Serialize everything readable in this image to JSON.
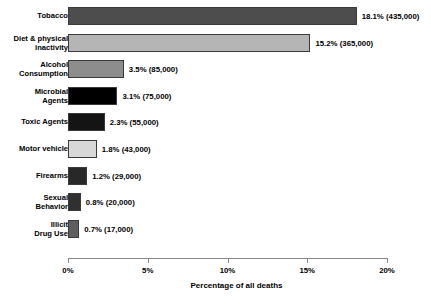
{
  "chart_data": {
    "type": "bar",
    "orientation": "horizontal",
    "title": "",
    "xlabel": "Percentage of all deaths",
    "ylabel": "",
    "xlim": [
      0,
      20
    ],
    "grid": false,
    "legend": "none",
    "xticks": [
      "0%",
      "5%",
      "10%",
      "15%",
      "20%"
    ],
    "xtick_values": [
      0,
      5,
      10,
      15,
      20
    ],
    "categories": [
      "Tobacco",
      "Diet & physical inactivity",
      "Alcohol Consumption",
      "Microbial Agents",
      "Toxic Agents",
      "Motor vehicle",
      "Firearms",
      "Sexual Behavior",
      "Illicit Drug Use"
    ],
    "values": [
      18.1,
      15.2,
      3.5,
      3.1,
      2.3,
      1.8,
      1.2,
      0.8,
      0.7
    ],
    "counts": [
      435000,
      365000,
      85000,
      75000,
      55000,
      43000,
      29000,
      20000,
      17000
    ],
    "bars": [
      {
        "label": "Tobacco",
        "label_lines": [
          "Tobacco"
        ],
        "value": 18.1,
        "count": 435000,
        "data_label": "18.1% (435,000)",
        "color": "#4d4d4d"
      },
      {
        "label": "Diet & physical inactivity",
        "label_lines": [
          "Diet & physical",
          "inactivity"
        ],
        "value": 15.2,
        "count": 365000,
        "data_label": "15.2% (365,000)",
        "color": "#b5b5b5"
      },
      {
        "label": "Alcohol Consumption",
        "label_lines": [
          "Alcohol",
          "Consumption"
        ],
        "value": 3.5,
        "count": 85000,
        "data_label": "3.5% (85,000)",
        "color": "#8d8d8d"
      },
      {
        "label": "Microbial Agents",
        "label_lines": [
          "Microbial",
          "Agents"
        ],
        "value": 3.1,
        "count": 75000,
        "data_label": "3.1% (75,000)",
        "color": "#000000"
      },
      {
        "label": "Toxic Agents",
        "label_lines": [
          "Toxic Agents"
        ],
        "value": 2.3,
        "count": 55000,
        "data_label": "2.3% (55,000)",
        "color": "#141414"
      },
      {
        "label": "Motor vehicle",
        "label_lines": [
          "Motor vehicle"
        ],
        "value": 1.8,
        "count": 43000,
        "data_label": "1.8% (43,000)",
        "color": "#d8d8d8"
      },
      {
        "label": "Firearms",
        "label_lines": [
          "Firearms"
        ],
        "value": 1.2,
        "count": 29000,
        "data_label": "1.2% (29,000)",
        "color": "#282828"
      },
      {
        "label": "Sexual Behavior",
        "label_lines": [
          "Sexual",
          "Behavior"
        ],
        "value": 0.8,
        "count": 20000,
        "data_label": "0.8% (20,000)",
        "color": "#303030"
      },
      {
        "label": "Illicit Drug Use",
        "label_lines": [
          "Illicit",
          "Drug Use"
        ],
        "value": 0.7,
        "count": 17000,
        "data_label": "0.7% (17,000)",
        "color": "#5e5e5e"
      }
    ]
  }
}
